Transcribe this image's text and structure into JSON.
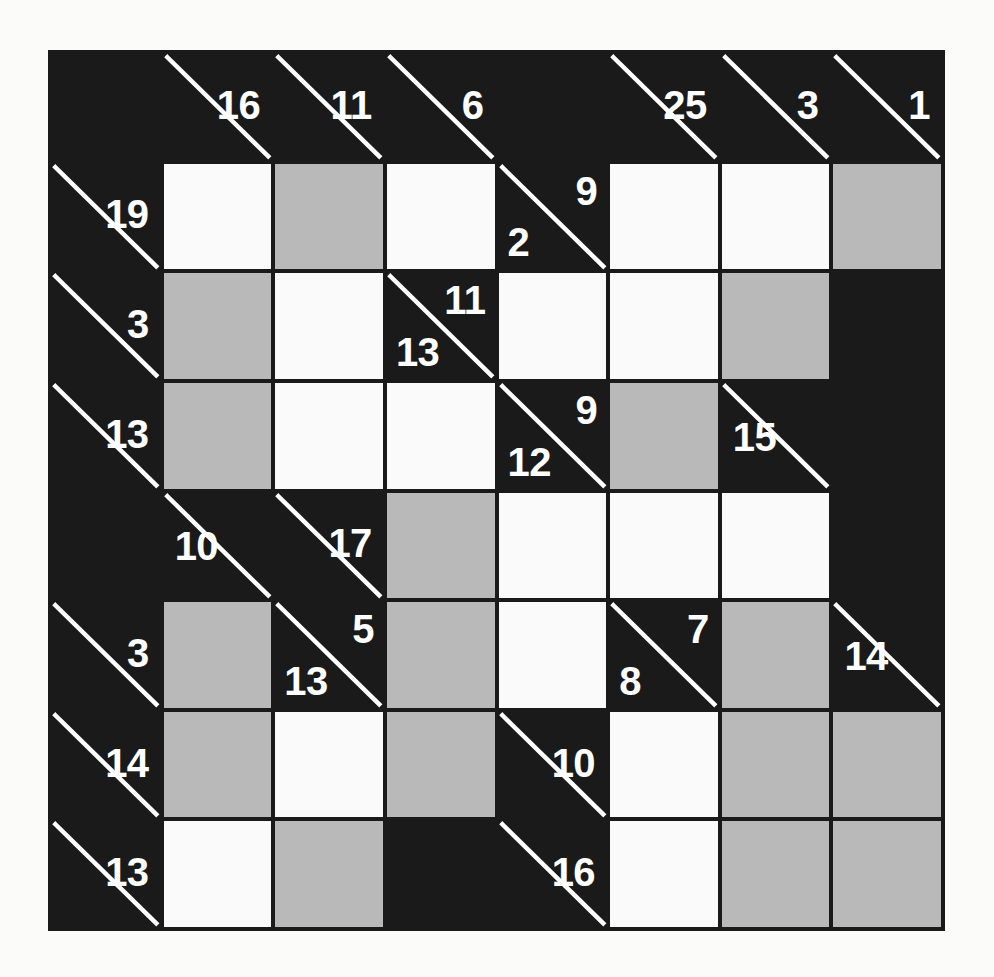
{
  "puzzle": {
    "type": "kakuro",
    "rows": 8,
    "cols": 8,
    "colors": {
      "clue_background": "#1a1a1a",
      "blank_background": "#1a1a1a",
      "answer_background": "#fafafa",
      "shaded_background": "#b9b9b9",
      "clue_text": "#ffffff",
      "grid_line": "#1a1a1a",
      "page_background": "#fbfbf9"
    },
    "grid": [
      [
        {
          "kind": "black"
        },
        {
          "kind": "clue",
          "across": "16",
          "down": ""
        },
        {
          "kind": "clue",
          "across": "11",
          "down": ""
        },
        {
          "kind": "clue",
          "across": "6",
          "down": ""
        },
        {
          "kind": "black"
        },
        {
          "kind": "clue",
          "across": "25",
          "down": ""
        },
        {
          "kind": "clue",
          "across": "3",
          "down": ""
        },
        {
          "kind": "clue",
          "across": "1",
          "down": ""
        }
      ],
      [
        {
          "kind": "clue",
          "across": "19",
          "down": ""
        },
        {
          "kind": "white"
        },
        {
          "kind": "shaded"
        },
        {
          "kind": "white"
        },
        {
          "kind": "clue",
          "across": "9",
          "down": "2"
        },
        {
          "kind": "white"
        },
        {
          "kind": "white"
        },
        {
          "kind": "shaded"
        }
      ],
      [
        {
          "kind": "clue",
          "across": "3",
          "down": ""
        },
        {
          "kind": "shaded"
        },
        {
          "kind": "white"
        },
        {
          "kind": "clue",
          "across": "11",
          "down": "13"
        },
        {
          "kind": "white"
        },
        {
          "kind": "white"
        },
        {
          "kind": "shaded"
        },
        {
          "kind": "black"
        }
      ],
      [
        {
          "kind": "clue",
          "across": "13",
          "down": ""
        },
        {
          "kind": "shaded"
        },
        {
          "kind": "white"
        },
        {
          "kind": "white"
        },
        {
          "kind": "clue",
          "across": "9",
          "down": "12"
        },
        {
          "kind": "shaded"
        },
        {
          "kind": "clue",
          "across": "",
          "down": "15"
        },
        {
          "kind": "black"
        }
      ],
      [
        {
          "kind": "black"
        },
        {
          "kind": "clue",
          "across": "",
          "down": "10"
        },
        {
          "kind": "clue",
          "across": "17",
          "down": ""
        },
        {
          "kind": "shaded"
        },
        {
          "kind": "white"
        },
        {
          "kind": "white"
        },
        {
          "kind": "white"
        },
        {
          "kind": "black"
        }
      ],
      [
        {
          "kind": "clue",
          "across": "3",
          "down": ""
        },
        {
          "kind": "shaded"
        },
        {
          "kind": "clue",
          "across": "5",
          "down": "13"
        },
        {
          "kind": "shaded"
        },
        {
          "kind": "white"
        },
        {
          "kind": "clue",
          "across": "7",
          "down": "8"
        },
        {
          "kind": "shaded"
        },
        {
          "kind": "clue",
          "across": "",
          "down": "14"
        }
      ],
      [
        {
          "kind": "clue",
          "across": "14",
          "down": ""
        },
        {
          "kind": "shaded"
        },
        {
          "kind": "white"
        },
        {
          "kind": "shaded"
        },
        {
          "kind": "clue",
          "across": "10",
          "down": ""
        },
        {
          "kind": "white"
        },
        {
          "kind": "shaded"
        },
        {
          "kind": "shaded"
        }
      ],
      [
        {
          "kind": "clue",
          "across": "13",
          "down": ""
        },
        {
          "kind": "white"
        },
        {
          "kind": "shaded"
        },
        {
          "kind": "black"
        },
        {
          "kind": "clue",
          "across": "16",
          "down": ""
        },
        {
          "kind": "white"
        },
        {
          "kind": "shaded"
        },
        {
          "kind": "shaded"
        }
      ]
    ]
  }
}
